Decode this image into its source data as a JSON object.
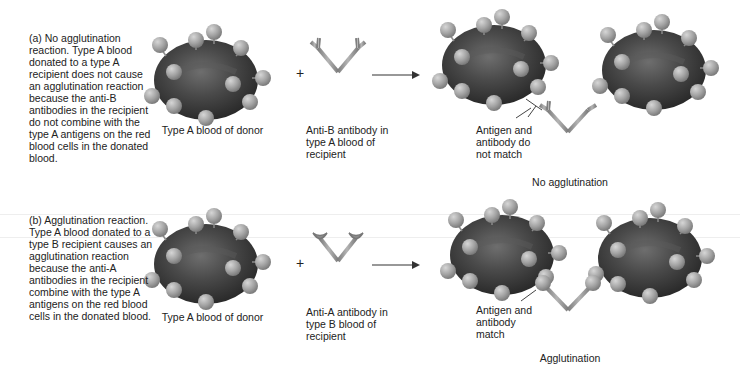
{
  "panel_a": {
    "description": "(a) No agglutination reaction. Type A blood donated to a type A recipient does not cause an agglutination reaction because the anti-B antibodies in the recipient do not combine with the type A antigens on the red blood cells in the donated blood.",
    "donor_label": "Type A blood of donor",
    "plus": "+",
    "antibody_label": "Anti-B antibody in type A blood of recipient",
    "match_label": "Antigen and antibody do not match",
    "result_label": "No agglutination"
  },
  "panel_b": {
    "description": "(b) Agglutination reaction. Type A blood donated to a type B recipient causes an agglutination reaction because the anti-A antibodies in the recipient combine with the type A antigens on the red blood cells in the donated blood.",
    "donor_label": "Type A blood of donor",
    "plus": "+",
    "antibody_label": "Anti-A antibody in type B blood of recipient",
    "match_label": "Antigen and antibody match",
    "result_label": "Agglutination"
  },
  "colors": {
    "cell": "#3e3e3e",
    "cell_highlight": "#6a6a6a",
    "antigen": "#a9a9a9",
    "antibody": "#9a9a9a",
    "text": "#222222"
  }
}
